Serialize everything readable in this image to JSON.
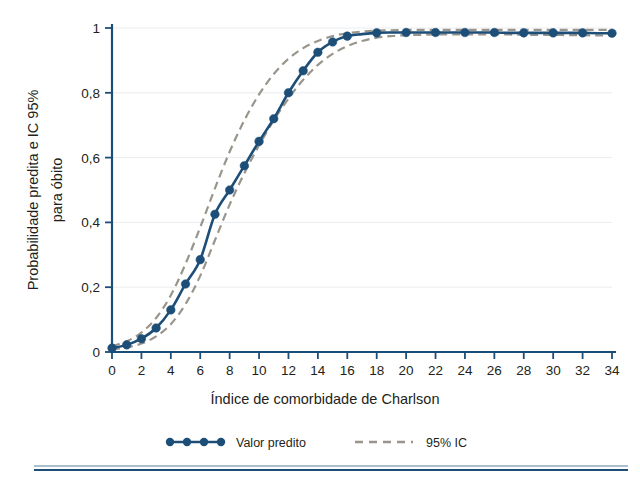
{
  "chart_data": {
    "type": "line",
    "title": "",
    "xlabel": "Índice de comorbidade de Charlson",
    "ylabel": "Probabilidade predita e IC 95%\npara óbito",
    "ylabel_line1": "Probabilidade predita e IC 95%",
    "ylabel_line2": "para óbito",
    "xlim": [
      0,
      34
    ],
    "ylim": [
      0,
      1
    ],
    "xticks": [
      0,
      2,
      4,
      6,
      8,
      10,
      12,
      14,
      16,
      18,
      20,
      22,
      24,
      26,
      28,
      30,
      32,
      34
    ],
    "xtick_labels": [
      "0",
      "2",
      "4",
      "6",
      "8",
      "10",
      "12",
      "14",
      "16",
      "18",
      "20",
      "22",
      "24",
      "26",
      "28",
      "30",
      "32",
      "34"
    ],
    "yticks": [
      0,
      0.2,
      0.4,
      0.6,
      0.8,
      1
    ],
    "ytick_labels": [
      "0",
      "0,2",
      "0,4",
      "0,6",
      "0,8",
      "1"
    ],
    "grid": "horizontal",
    "legend_position": "bottom",
    "x": [
      0,
      1,
      2,
      3,
      4,
      5,
      6,
      7,
      8,
      9,
      10,
      11,
      12,
      13,
      14,
      15,
      16,
      17,
      18,
      19,
      20,
      21,
      22,
      23,
      24,
      25,
      26,
      27,
      28,
      29,
      30,
      31,
      32,
      33,
      34
    ],
    "series": [
      {
        "name": "Valor predito",
        "style": "solid-markers",
        "color": "#1d4e77",
        "marker": "circle",
        "marker_x": [
          0,
          1,
          2,
          3,
          4,
          5,
          6,
          7,
          8,
          9,
          10,
          11,
          12,
          13,
          14,
          15,
          16,
          18,
          20,
          22,
          24,
          26,
          28,
          30,
          32,
          34
        ],
        "marker_values": [
          0.012,
          0.022,
          0.041,
          0.074,
          0.13,
          0.21,
          0.285,
          0.425,
          0.5,
          0.575,
          0.65,
          0.72,
          0.8,
          0.868,
          0.925,
          0.957,
          0.975,
          0.985,
          0.986,
          0.986,
          0.986,
          0.986,
          0.985,
          0.985,
          0.985,
          0.984
        ],
        "values": [
          0.012,
          0.022,
          0.041,
          0.074,
          0.13,
          0.21,
          0.285,
          0.425,
          0.5,
          0.575,
          0.65,
          0.72,
          0.8,
          0.868,
          0.925,
          0.957,
          0.975,
          0.981,
          0.985,
          0.986,
          0.986,
          0.986,
          0.986,
          0.986,
          0.986,
          0.986,
          0.986,
          0.985,
          0.985,
          0.985,
          0.985,
          0.985,
          0.985,
          0.984,
          0.984
        ]
      },
      {
        "name": "95% IC",
        "style": "dashed",
        "color": "#9a958c",
        "bound": "upper",
        "values": [
          0.018,
          0.033,
          0.06,
          0.105,
          0.175,
          0.272,
          0.385,
          0.505,
          0.618,
          0.715,
          0.795,
          0.858,
          0.905,
          0.938,
          0.96,
          0.975,
          0.984,
          0.989,
          0.992,
          0.993,
          0.994,
          0.994,
          0.994,
          0.994,
          0.994,
          0.994,
          0.994,
          0.994,
          0.994,
          0.994,
          0.994,
          0.994,
          0.994,
          0.994,
          0.994
        ]
      },
      {
        "name": "95% IC",
        "style": "dashed",
        "color": "#9a958c",
        "bound": "lower",
        "values": [
          0.008,
          0.014,
          0.026,
          0.048,
          0.086,
          0.148,
          0.235,
          0.345,
          0.455,
          0.552,
          0.638,
          0.715,
          0.782,
          0.84,
          0.886,
          0.92,
          0.944,
          0.96,
          0.97,
          0.975,
          0.978,
          0.979,
          0.98,
          0.98,
          0.98,
          0.98,
          0.98,
          0.98,
          0.979,
          0.979,
          0.979,
          0.978,
          0.978,
          0.977,
          0.977
        ]
      }
    ]
  },
  "legend": {
    "items": [
      {
        "label": "Valor predito",
        "style": "solid-markers",
        "color": "#1d4e77"
      },
      {
        "label": "95% IC",
        "style": "dashed",
        "color": "#9a958c"
      }
    ]
  },
  "colors": {
    "predicted": "#1d4e77",
    "confidence_interval": "#9a958c",
    "grid": "#e9ecef",
    "axis": "#1d4e77",
    "text": "#231f20",
    "background": "#ffffff"
  }
}
